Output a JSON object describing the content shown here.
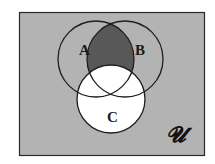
{
  "diagram": {
    "type": "venn",
    "universe_label": "𝓤",
    "sets": [
      {
        "name": "A",
        "label": "A",
        "cx": 96,
        "cy": 59,
        "r": 38
      },
      {
        "name": "B",
        "label": "B",
        "cx": 125,
        "cy": 59,
        "r": 38
      },
      {
        "name": "C",
        "label": "C",
        "cx": 111,
        "cy": 99,
        "r": 34
      }
    ],
    "shaded_region": "A ∩ B − C",
    "colors": {
      "universe": "#b3b3b3",
      "shaded": "#585858",
      "set_c_fill": "#ffffff",
      "stroke": "#1e1e1e"
    }
  }
}
